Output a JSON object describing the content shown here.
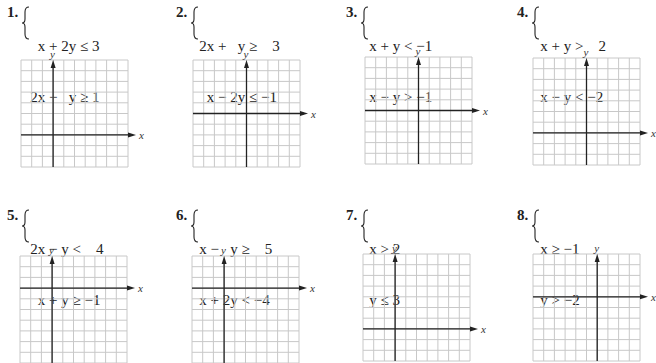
{
  "problems": [
    {
      "number": "1.",
      "inequalities": [
        "  x + 2y ≤ 3",
        "2x −   y ≥ 1"
      ],
      "graph": {
        "x_label": "x",
        "y_label": "y",
        "cols": 10,
        "rows": 10,
        "y_axis_col": 3,
        "x_axis_row": 7
      }
    },
    {
      "number": "2.",
      "inequalities": [
        "2x +   y ≥    3",
        "  x − 2y ≤ −1"
      ],
      "graph": {
        "x_label": "x",
        "y_label": "y",
        "cols": 10,
        "rows": 10,
        "y_axis_col": 5,
        "x_axis_row": 5
      }
    },
    {
      "number": "3.",
      "inequalities": [
        "x + y < −1",
        "x − y > −1"
      ],
      "graph": {
        "x_label": "x",
        "y_label": "y",
        "cols": 10,
        "rows": 10,
        "y_axis_col": 5,
        "x_axis_row": 5
      }
    },
    {
      "number": "4.",
      "inequalities": [
        "x + y >    2",
        "x − y < −2"
      ],
      "graph": {
        "x_label": "x",
        "y_label": "y",
        "cols": 10,
        "rows": 10,
        "y_axis_col": 5,
        "x_axis_row": 7
      }
    },
    {
      "number": "5.",
      "inequalities": [
        "2x − y <    4",
        "  x + y ≥ −1"
      ],
      "graph": {
        "x_label": "x",
        "y_label": "y",
        "cols": 10,
        "rows": 10,
        "y_axis_col": 3,
        "x_axis_row": 3
      }
    },
    {
      "number": "6.",
      "inequalities": [
        "x −   y ≥    5",
        "x + 2y < −4"
      ],
      "graph": {
        "x_label": "x",
        "y_label": "y",
        "cols": 10,
        "rows": 10,
        "y_axis_col": 3,
        "x_axis_row": 3
      }
    },
    {
      "number": "7.",
      "inequalities": [
        "x > 2",
        "y ≤ 3"
      ],
      "graph": {
        "x_label": "x",
        "y_label": "y",
        "cols": 10,
        "rows": 10,
        "y_axis_col": 3,
        "x_axis_row": 7
      }
    },
    {
      "number": "8.",
      "inequalities": [
        "x ≥ −1",
        "y > −2"
      ],
      "graph": {
        "x_label": "x",
        "y_label": "y",
        "cols": 10,
        "rows": 10,
        "y_axis_col": 6,
        "x_axis_row": 4
      }
    }
  ],
  "colors": {
    "grid": "#c8c8c8",
    "axis": "#222222",
    "text": "#222222"
  }
}
